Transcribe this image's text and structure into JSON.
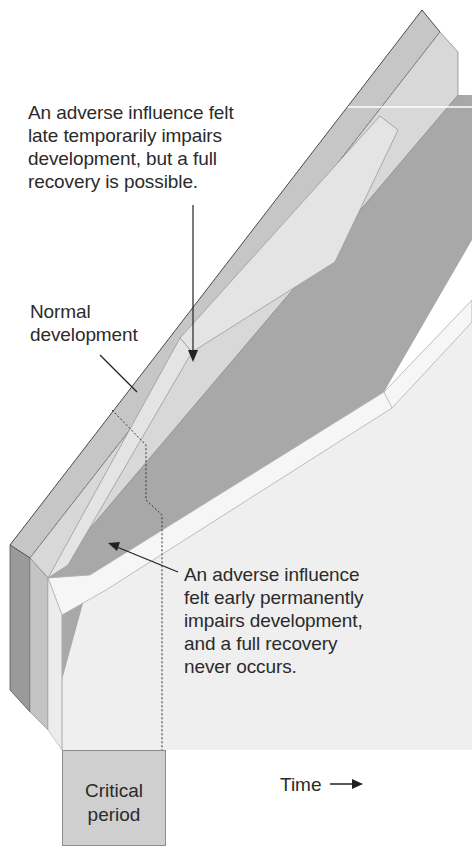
{
  "figure": {
    "top_cut_text": "...",
    "annotations": {
      "late_influence": "An adverse influence felt\nlate temporarily impairs\ndevelopment, but a full\nrecovery is possible.",
      "normal": "Normal\ndevelopment",
      "early_influence": "An adverse influence\nfelt early permanently\nimpairs development,\nand a full recovery\nnever occurs."
    },
    "critical_period_label": "Critical\nperiod",
    "time_label": "Time",
    "colors": {
      "outer_band": "#c9c9c9",
      "outer_band_edge": "#555555",
      "inner_band": "#dcdcdc",
      "mid_gray": "#a9a9a9",
      "dark_gray": "#8f8f8f",
      "light_panel": "#efefef",
      "white_band": "#f7f7f7",
      "critical_box": "#cfcfcf"
    }
  }
}
